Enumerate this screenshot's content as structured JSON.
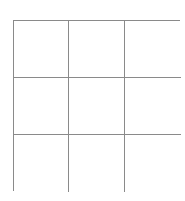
{
  "game": {
    "type": "tic-tac-toe",
    "rows": 3,
    "cols": 3,
    "cells": [
      [
        "",
        "",
        ""
      ],
      [
        "",
        "",
        ""
      ],
      [
        "",
        "",
        ""
      ]
    ]
  },
  "colors": {
    "grid_line": "#8a8a8a",
    "background": "#ffffff"
  }
}
